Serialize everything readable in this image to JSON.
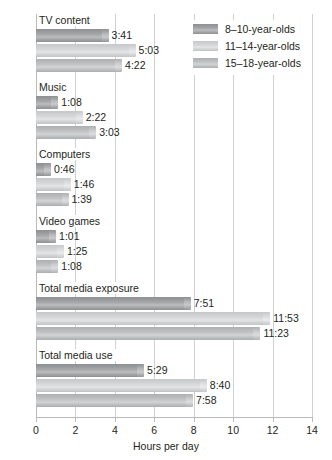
{
  "chart_data": {
    "type": "bar",
    "orientation": "horizontal",
    "title": "",
    "xlabel": "Hours per day",
    "ylabel": "Activity",
    "xlim": [
      0,
      14
    ],
    "xticks": [
      0,
      2,
      4,
      6,
      8,
      10,
      12,
      14
    ],
    "xtick_labels": [
      "0",
      "2",
      "4",
      "6",
      "8",
      "10",
      "12",
      "14"
    ],
    "grid": true,
    "legend_position": "top-right",
    "categories": [
      "TV content",
      "Music",
      "Computers",
      "Video games",
      "Total media exposure",
      "Total media use"
    ],
    "series": [
      {
        "name": "8–10-year-olds",
        "color": "#9a9b9d",
        "values": [
          3.683,
          1.133,
          0.767,
          1.017,
          7.85,
          5.483
        ],
        "labels": [
          "3:41",
          "1:08",
          "0:46",
          "1:01",
          "7:51",
          "5:29"
        ]
      },
      {
        "name": "11–14-year-olds",
        "color": "#d4d5d7",
        "values": [
          5.05,
          2.367,
          1.767,
          1.417,
          11.883,
          8.667
        ],
        "labels": [
          "5:03",
          "2:22",
          "1:46",
          "1:25",
          "11:53",
          "8:40"
        ]
      },
      {
        "name": "15–18-year-olds",
        "color": "#bcbdbf",
        "values": [
          4.367,
          3.05,
          1.65,
          1.133,
          11.383,
          7.967
        ],
        "labels": [
          "4:22",
          "3:03",
          "1:39",
          "1:08",
          "11:23",
          "7:58"
        ]
      }
    ]
  },
  "legend": {
    "entries": [
      {
        "label": "8–10-year-olds"
      },
      {
        "label": "11–14-year-olds"
      },
      {
        "label": "15–18-year-olds"
      }
    ]
  },
  "axes": {
    "x_title": "Hours per day",
    "y_title": "Activity"
  }
}
